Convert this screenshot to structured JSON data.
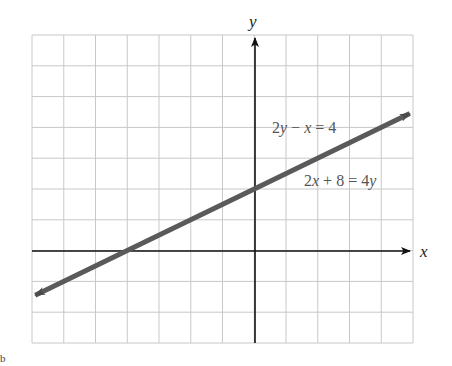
{
  "chart_data": {
    "type": "line",
    "title": "",
    "xlabel": "x",
    "ylabel": "y",
    "xlim": [
      -7,
      5
    ],
    "ylim": [
      -3,
      7
    ],
    "grid": true,
    "grid_step": 1,
    "series": [
      {
        "name": "2y − x = 4 (equivalent to 2x + 8 = 4y)",
        "equation": "y = 0.5x + 2",
        "x": [
          -6.9,
          -4,
          0,
          4.9
        ],
        "values": [
          -1.45,
          0,
          2,
          4.45
        ],
        "color": "#5a5a5a",
        "arrows": "both"
      }
    ],
    "annotations": [
      {
        "text": "2y − x = 4",
        "x": 1.5,
        "y": 3.8
      },
      {
        "text": "2x + 8 = 4y",
        "x": 3.0,
        "y": 2.2
      }
    ]
  },
  "labels": {
    "x_axis": "x",
    "y_axis": "y",
    "eq1_parts": [
      "2",
      "y",
      " − ",
      "x",
      " = 4"
    ],
    "eq2_parts": [
      "2",
      "x",
      " + 8 = 4",
      "y"
    ],
    "part_marker": "b"
  },
  "colors": {
    "grid": "#c8c8c8",
    "axis": "#111111",
    "line": "#5a5a5a",
    "label": "#555555"
  }
}
